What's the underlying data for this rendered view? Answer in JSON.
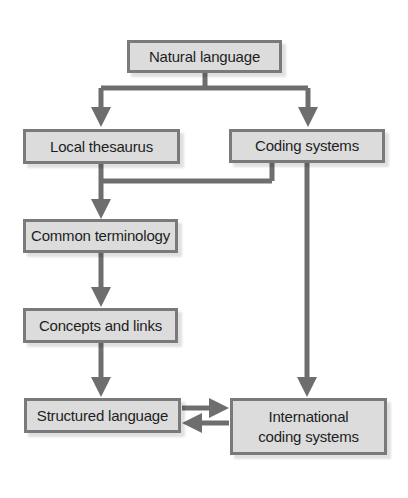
{
  "diagram": {
    "type": "flowchart",
    "colors": {
      "box_fill": "#dcdcdc",
      "box_border": "#7a7a7a",
      "arrow": "#6e6e6e",
      "text": "#1e1e1e"
    },
    "nodes": [
      {
        "id": "natural",
        "label": "Natural language"
      },
      {
        "id": "local",
        "label": "Local thesaurus"
      },
      {
        "id": "coding",
        "label": "Coding systems"
      },
      {
        "id": "common",
        "label": "Common terminology"
      },
      {
        "id": "concepts",
        "label": "Concepts and links"
      },
      {
        "id": "structured",
        "label": "Structured language"
      },
      {
        "id": "international",
        "label": "International\ncoding systems"
      }
    ],
    "edges": [
      {
        "from": "natural",
        "to": "local"
      },
      {
        "from": "natural",
        "to": "coding"
      },
      {
        "from": "local",
        "to": "common"
      },
      {
        "from": "coding",
        "to": "common"
      },
      {
        "from": "coding",
        "to": "international"
      },
      {
        "from": "common",
        "to": "concepts"
      },
      {
        "from": "concepts",
        "to": "structured"
      },
      {
        "from": "structured",
        "to": "international"
      },
      {
        "from": "international",
        "to": "structured"
      }
    ]
  }
}
